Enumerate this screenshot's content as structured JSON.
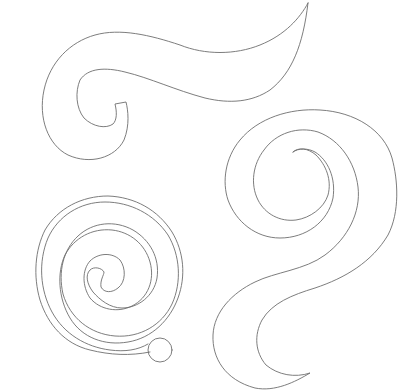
{
  "canvas": {
    "width": 415,
    "height": 391,
    "background": "#ffffff",
    "stroke_color": "#6e6e6e"
  },
  "shapes": [
    {
      "name": "wave-hook-shape",
      "description": "Top swirl: wave tail ending in a sharp point at upper right, curling into a hook at left",
      "path": "M308,3 C300,18 285,35 260,45 C235,55 205,55 180,45 C150,35 120,28 95,35 C70,42 50,62 44,90 C38,118 48,145 68,155 C90,165 115,158 124,140 C130,125 128,110 126,102 L115,104 C117,112 117,120 113,124 C106,129 93,127 84,118 C76,108 75,92 80,80 C88,68 105,67 125,72 C150,78 175,90 205,98 C230,104 252,102 270,90 C292,73 303,45 308,3 Z"
    },
    {
      "name": "spiral-s-shape",
      "description": "Right swirl: spiral coil at top with an S-shaped tail sweeping down-left to a point",
      "path": "M293,152 C298,147 308,148 316,155 C326,165 332,180 328,195 C324,208 310,218 296,220 C280,222 265,214 258,200 C250,184 253,164 264,150 C276,133 298,126 318,132 C340,140 355,162 358,187 C361,212 348,238 325,255 C305,270 275,272 255,282 C232,293 214,312 213,335 C212,358 225,380 255,388 C275,392 295,382 310,373 C295,378 278,375 266,365 C255,352 254,335 262,320 C272,303 292,295 315,288 C345,278 372,262 388,235 C400,212 398,180 392,158 C384,130 355,112 320,110 C290,108 258,118 240,140 C225,158 222,182 228,200 C236,222 256,238 280,238 C306,238 328,222 333,198 C336,178 328,160 315,152 C308,148 298,148 293,152 Z"
    },
    {
      "name": "coiled-spiral-shape",
      "description": "Bottom-left swirl: tightly wound spiral with a round knob at the lower-right end",
      "path": "M150,352 C130,356 110,355 90,350 C65,344 48,325 40,300 C33,276 35,250 45,230 C58,208 82,196 108,196 C135,197 158,210 172,232 C184,252 186,276 178,298 C170,320 152,338 128,342 C105,346 82,338 70,318 C58,298 57,272 65,255 C74,238 92,228 112,230 C130,232 145,244 150,262 C155,280 148,298 132,306 C118,313 100,310 90,298 C82,286 82,270 90,261 C98,253 112,252 120,260 C126,268 126,282 118,288 C112,293 104,293 101,287 C100,280 104,275 104,272 C102,268 94,266 90,270 C85,275 87,284 93,292 C100,300 110,308 122,308 C138,308 154,296 157,278 C160,258 150,240 133,230 C115,220 93,222 78,236 C63,250 58,272 63,294 C70,318 90,334 115,336 C140,338 162,325 172,304 C182,282 180,255 168,235 C154,214 130,202 105,202 C80,202 58,216 48,238 C38,262 40,290 52,312 C64,334 86,347 110,350 C125,352 138,350 148,344"
    },
    {
      "name": "spiral-knob",
      "description": "Round knob terminating the bottom-left spiral",
      "circle": {
        "cx": 160,
        "cy": 350,
        "r": 12
      }
    }
  ]
}
